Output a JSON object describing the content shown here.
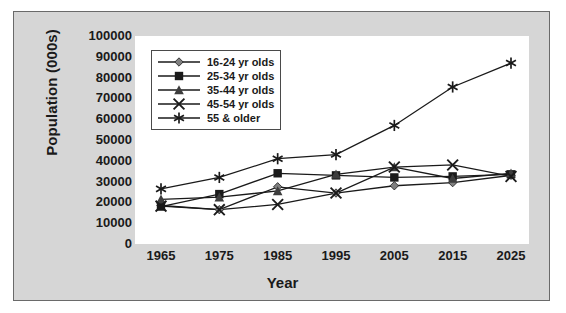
{
  "chart_data": {
    "type": "line",
    "title": "",
    "xlabel": "Year",
    "ylabel": "Population (000s)",
    "x": [
      1965,
      1975,
      1985,
      1995,
      2005,
      2015,
      2025
    ],
    "xticklabels": [
      "1965",
      "1975",
      "1985",
      "1995",
      "2005",
      "2015",
      "2025"
    ],
    "yticklabels": [
      "100000",
      "90000",
      "80000",
      "70000",
      "60000",
      "50000",
      "40000",
      "30000",
      "20000",
      "10000",
      "0"
    ],
    "ylim": [
      0,
      100000
    ],
    "ytick_step": 10000,
    "grid": false,
    "legend_position": "upper-left-inside",
    "series": [
      {
        "name": "16-24 yr olds",
        "marker": "diamond",
        "color": "#808080",
        "values": [
          18500,
          16500,
          27500,
          24500,
          28000,
          29500,
          33000
        ]
      },
      {
        "name": "25-34 yr olds",
        "marker": "square",
        "color": "#1a1a1a",
        "values": [
          18000,
          24000,
          34000,
          33000,
          32000,
          32500,
          33500
        ]
      },
      {
        "name": "35-44 yr olds",
        "marker": "triangle",
        "color": "#3d3d3d",
        "values": [
          21500,
          22500,
          25500,
          33500,
          37000,
          31500,
          34000
        ]
      },
      {
        "name": "45-54 yr olds",
        "marker": "x",
        "color": "#1a1a1a",
        "values": [
          18200,
          16500,
          19000,
          24500,
          37000,
          38000,
          32500
        ]
      },
      {
        "name": "55 & older",
        "marker": "asterisk",
        "color": "#1a1a1a",
        "values": [
          26500,
          32000,
          41000,
          43000,
          57000,
          75500,
          87000
        ]
      }
    ]
  },
  "axis": {
    "y_title": "Population (000s)",
    "x_title": "Year",
    "yticks": [
      "100000",
      "90000",
      "80000",
      "70000",
      "60000",
      "50000",
      "40000",
      "30000",
      "20000",
      "10000",
      "0"
    ],
    "xticks": [
      "1965",
      "1975",
      "1985",
      "1995",
      "2005",
      "2015",
      "2025"
    ]
  },
  "legend": {
    "items": [
      {
        "label": "16-24 yr olds"
      },
      {
        "label": "25-34 yr olds"
      },
      {
        "label": "35-44 yr olds"
      },
      {
        "label": "45-54 yr olds"
      },
      {
        "label": "55 & older"
      }
    ]
  }
}
